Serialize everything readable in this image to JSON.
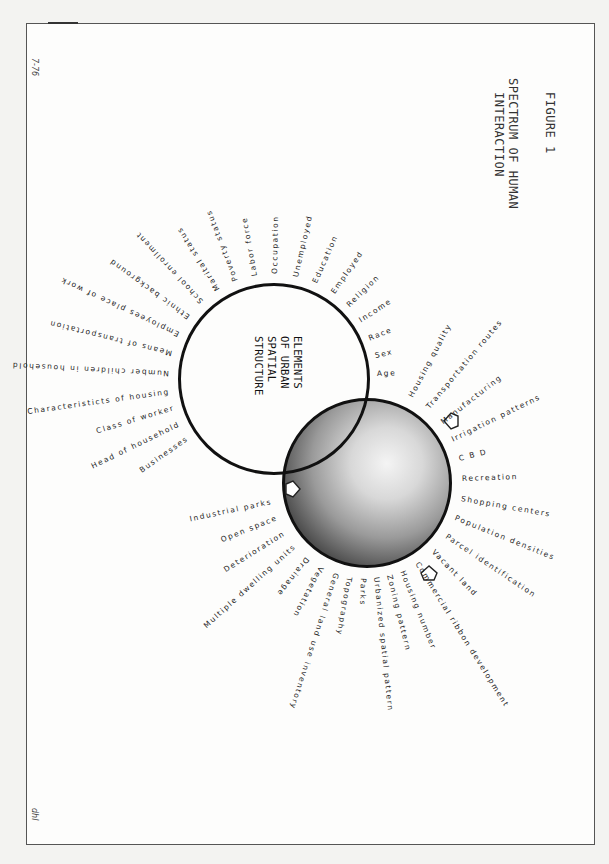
{
  "figure": {
    "label": "FIGURE 1",
    "title_line1": "SPECTRUM OF HUMAN",
    "title_line2": "INTERACTION",
    "date_code": "7-76",
    "initials": "dhl"
  },
  "center_circle": {
    "line1": "ELEMENTS",
    "line2": "OF URBAN",
    "line3": "SPATIAL",
    "line4": "STRUCTURE"
  },
  "socioeconomic_labels": [
    "Age",
    "Sex",
    "Race",
    "Income",
    "Religion",
    "Employed",
    "Education",
    "Unemployed",
    "Occupation",
    "Labor force",
    "Poverty status",
    "Marital status",
    "School enrollment",
    "Ethnic background",
    "Employees place of work",
    "Means of transportation",
    "Number children in household",
    "Characteristicts of housing",
    "Class of worker",
    "Head of household",
    "Businesses"
  ],
  "land_use_labels_left": [
    "Industrial parks",
    "Open space",
    "Deterioration",
    "Multiple dwelling units",
    "Drainage",
    "Vegetation",
    "General land use inventory",
    "Topography",
    "Parks",
    "Urbanized spatial pattern",
    "Zoning pattern",
    "Housing number",
    "Commercial ribbon development"
  ],
  "land_use_labels_right": [
    "Housing quality",
    "Transportation routes",
    "Manufacturing",
    "Irrigation patterns",
    "C B D",
    "Recreation",
    "Shopping centers",
    "Population densities",
    "Parcel identification",
    "Vacant land"
  ],
  "colors": {
    "ink": "#1e1e1e",
    "paper": "#fdfdfc",
    "background": "#f3f3f1"
  }
}
